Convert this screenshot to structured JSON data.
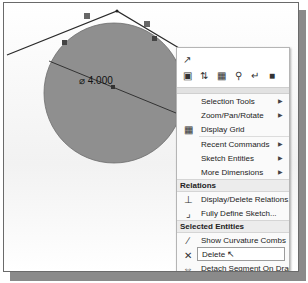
{
  "sketch": {
    "dimension_label": "⌀ 4.000",
    "circle_color": "#8f8f8f",
    "line_color": "#2a2a2a"
  },
  "menu": {
    "toolbar_icons": [
      "smart-dimension-icon",
      "view-orientation-icon",
      "section-view-icon",
      "annotation-icon",
      "zoom-icon",
      "sketch-icon",
      "display-style-icon"
    ],
    "items": [
      {
        "label": "Selection Tools",
        "submenu": true
      },
      {
        "label": "Zoom/Pan/Rotate",
        "submenu": true
      },
      {
        "label": "Display Grid",
        "submenu": false,
        "icon": "grid-icon"
      },
      {
        "label": "Recent Commands",
        "submenu": true
      },
      {
        "label": "Sketch Entities",
        "submenu": true
      },
      {
        "label": "More Dimensions",
        "submenu": true
      }
    ],
    "relations": {
      "header": "Relations",
      "items": [
        {
          "label": "Display/Delete Relations...",
          "icon": "relations-icon"
        },
        {
          "label": "Fully Define Sketch...",
          "icon": "fully-define-icon"
        }
      ]
    },
    "selected_entities": {
      "header": "Selected Entities",
      "items": [
        {
          "label": "Show Curvature Combs",
          "icon": "curvature-icon"
        },
        {
          "label": "Delete",
          "icon": "delete-icon",
          "highlighted": true
        },
        {
          "label": "Detach Segment On Drag",
          "icon": "detach-icon"
        },
        {
          "label": "Sketch Tools",
          "submenu": true
        }
      ]
    },
    "arrow_glyph": "▶"
  }
}
